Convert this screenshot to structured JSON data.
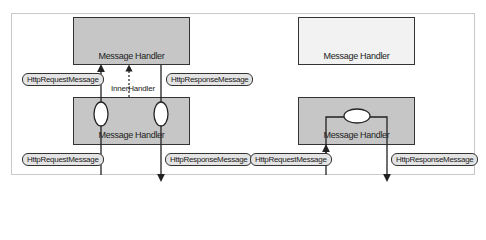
{
  "diagram": {
    "left_panel": {
      "outer_handler": {
        "label": "Message Handler"
      },
      "inner_handler": {
        "label": "Message Handler"
      },
      "inner_handler_link_label": "InnerHandler",
      "top_request_label": "HttpRequestMessage",
      "top_response_label": "HttpResponseMessage",
      "bottom_request_label": "HttpRequestMessage",
      "bottom_response_label": "HttpResponseMessage"
    },
    "right_panel": {
      "top_handler": {
        "label": "Message Handler"
      },
      "bottom_handler": {
        "label": "Message Handler"
      },
      "request_label": "HttpRequestMessage",
      "response_label": "HttpResponseMessage"
    },
    "colors": {
      "handler_gray": "#c6c6c6",
      "handler_light": "#f2f2f2",
      "pill_fill": "#e4e4e4",
      "stroke": "#333333"
    }
  }
}
